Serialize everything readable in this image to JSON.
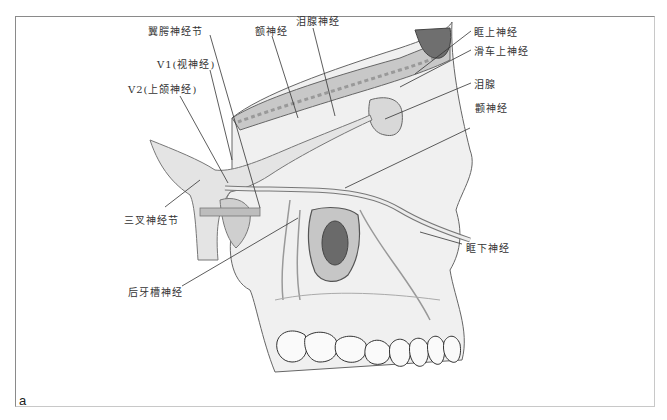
{
  "figure": {
    "panel_label": "a",
    "labels": [
      {
        "id": "pterygopalatine-ganglion",
        "text": "翼腭神经节",
        "x": 148,
        "y": 23,
        "lx1": 210,
        "ly1": 35,
        "lx2": 260,
        "ly2": 208
      },
      {
        "id": "frontal-nerve",
        "text": "额神经",
        "x": 255,
        "y": 23,
        "lx1": 272,
        "ly1": 36,
        "lx2": 298,
        "ly2": 118
      },
      {
        "id": "lacrimal-nerve",
        "text": "泪腺神经",
        "x": 296,
        "y": 13,
        "lx1": 313,
        "ly1": 28,
        "lx2": 335,
        "ly2": 116
      },
      {
        "id": "v1-ophthalmic",
        "text": "V1(视神经)",
        "x": 157,
        "y": 56,
        "lx1": 210,
        "ly1": 70,
        "lx2": 232,
        "ly2": 160
      },
      {
        "id": "v2-maxillary",
        "text": "V2(上颌神经)",
        "x": 128,
        "y": 81,
        "lx1": 180,
        "ly1": 96,
        "lx2": 228,
        "ly2": 183
      },
      {
        "id": "supraorbital-nerve",
        "text": "眶上神经",
        "x": 474,
        "y": 24,
        "lx1": 471,
        "ly1": 31,
        "lx2": 415,
        "ly2": 74
      },
      {
        "id": "supratrochlear-nerve",
        "text": "滑车上神经",
        "x": 474,
        "y": 43,
        "lx1": 471,
        "ly1": 50,
        "lx2": 400,
        "ly2": 87
      },
      {
        "id": "lacrimal-gland",
        "text": "泪腺",
        "x": 474,
        "y": 76,
        "lx1": 471,
        "ly1": 83,
        "lx2": 385,
        "ly2": 119
      },
      {
        "id": "zygomatic-nerve",
        "text": "颧神经",
        "x": 475,
        "y": 100,
        "lx1": 470,
        "ly1": 128,
        "lx2": 345,
        "ly2": 188
      },
      {
        "id": "trigeminal-ganglion",
        "text": "三叉神经节",
        "x": 124,
        "y": 212,
        "lx1": 165,
        "ly1": 207,
        "lx2": 200,
        "ly2": 180
      },
      {
        "id": "infraorbital-nerve",
        "text": "眶下神经",
        "x": 466,
        "y": 240,
        "lx1": 462,
        "ly1": 244,
        "lx2": 420,
        "ly2": 232
      },
      {
        "id": "posterior-superior-alveolar-nerve",
        "text": "后牙槽神经",
        "x": 128,
        "y": 284,
        "lx1": 182,
        "ly1": 286,
        "lx2": 298,
        "ly2": 218
      }
    ]
  },
  "colors": {
    "bone_fill": "#e6e6e6",
    "bone_dark": "#b8b8b8",
    "orbit_fill": "#c4c4c4",
    "sinus_fill": "#7a7a7a",
    "nerve": "#ececec",
    "outline": "#555555",
    "leader": "#333333",
    "frame": "#8a8a8a"
  }
}
